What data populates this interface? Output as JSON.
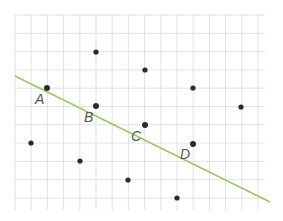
{
  "diagram": {
    "grid": {
      "x_start": 15,
      "x_end": 265,
      "x_step": 16.2,
      "y_start": 15,
      "y_end": 210,
      "y_step": 18.3,
      "color": "#e2e2e2"
    },
    "line": {
      "x1": 15,
      "y1": 76,
      "x2": 270,
      "y2": 202,
      "color": "#9cc46a"
    },
    "point_color": "#2b2b2b",
    "labeled_points": [
      {
        "label": "A",
        "x": 47,
        "y": 88,
        "lx": 35,
        "ly": 104
      },
      {
        "label": "B",
        "x": 96,
        "y": 106,
        "lx": 84,
        "ly": 122
      },
      {
        "label": "C",
        "x": 145,
        "y": 125,
        "lx": 131,
        "ly": 141
      },
      {
        "label": "D",
        "x": 193,
        "y": 144,
        "lx": 180,
        "ly": 159
      }
    ],
    "other_points": [
      {
        "x": 96,
        "y": 52
      },
      {
        "x": 145,
        "y": 70
      },
      {
        "x": 193,
        "y": 88
      },
      {
        "x": 241,
        "y": 107
      },
      {
        "x": 31,
        "y": 143
      },
      {
        "x": 80,
        "y": 161
      },
      {
        "x": 128,
        "y": 180
      },
      {
        "x": 177,
        "y": 198
      }
    ]
  }
}
